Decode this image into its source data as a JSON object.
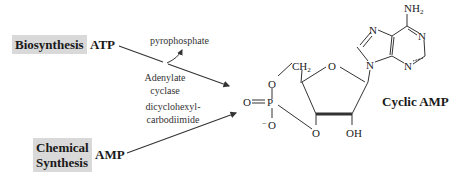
{
  "diagram": {
    "routes": {
      "biosynthesis": {
        "label": "Biosynthesis",
        "substrate": "ATP",
        "enzyme_line1": "Adenylate",
        "enzyme_line2": "cyclase",
        "byproduct": "pyrophosphate"
      },
      "chemical": {
        "label_line1": "Chemical",
        "label_line2": "Synthesis",
        "substrate": "AMP",
        "reagent_line1": "dicyclohexyl-",
        "reagent_line2": "carbodiimide"
      }
    },
    "product": {
      "name": "Cyclic AMP",
      "atoms": {
        "nh2": "NH",
        "nh2_sub": "2",
        "n1": "N",
        "n3": "N",
        "n7": "N",
        "n9": "N",
        "ring_o": "O",
        "ch2": "CH",
        "ch2_sub": "2",
        "o5": "O",
        "p": "P",
        "o_double": "O",
        "o_minus": "O",
        "minus": "−",
        "o3": "O",
        "oh": "OH"
      }
    },
    "colors": {
      "label_bg": "#d9d9d9",
      "line": "#333333",
      "text": "#1a1a1a"
    }
  }
}
